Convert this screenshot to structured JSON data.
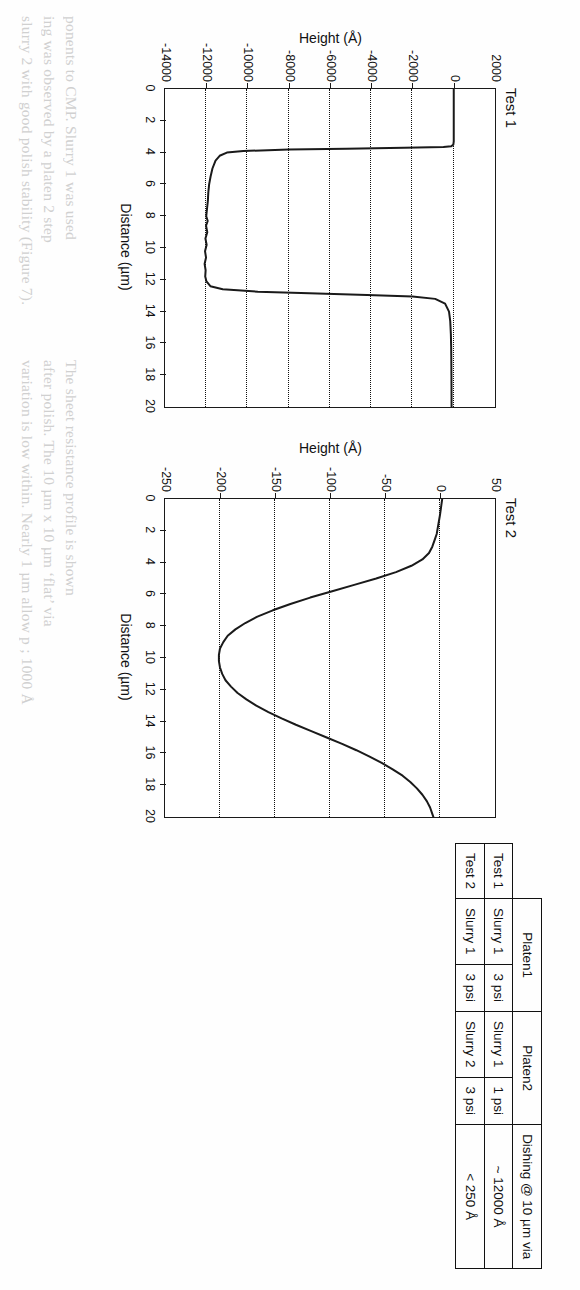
{
  "document": {
    "background_color": "#ffffff",
    "ink_color": "#1a1a1a"
  },
  "table": {
    "name": "cmp-process-comparison-table",
    "corner_label": "",
    "group_headers": [
      "",
      "Platen1",
      "Platen2",
      "Dishing @ 10 µm via"
    ],
    "sub_headers": [
      "Slurry 1",
      "3 psi",
      "Slurry 1",
      "1 psi"
    ],
    "rows": [
      {
        "test": "Test 1",
        "platen1_slurry": "Slurry 1",
        "platen1_pressure": "3 psi",
        "platen2_slurry": "Slurry 1",
        "platen2_pressure": "1 psi",
        "dishing": "~ 12000 Å"
      },
      {
        "test": "Test 2",
        "platen1_slurry": "Slurry 1",
        "platen1_pressure": "3 psi",
        "platen2_slurry": "Slurry 2",
        "platen2_pressure": "3 psi",
        "dishing": "< 250 Å"
      }
    ]
  },
  "chart_data": [
    {
      "type": "line",
      "name": "test1-profile",
      "title": "Test 1",
      "xlabel": "Distance (µm)",
      "ylabel": "Height (Å)",
      "xlim": [
        0,
        20
      ],
      "ylim": [
        -14000,
        2000
      ],
      "xticks": [
        0,
        2,
        4,
        6,
        8,
        10,
        12,
        14,
        16,
        18,
        20
      ],
      "xticklabels": [
        "0",
        "2",
        "4",
        "6",
        "8",
        "10",
        "12",
        "14",
        "16",
        "18",
        "20"
      ],
      "yticks": [
        2000,
        0,
        -2000,
        -4000,
        -6000,
        -8000,
        -10000,
        -12000,
        -14000
      ],
      "yticklabels": [
        "2000",
        "0",
        "-2000",
        "-4000",
        "-6000",
        "-8000",
        "-10000",
        "-12000",
        "-14000"
      ],
      "grid": "horizontal-dotted-at-yticks",
      "legend": "none",
      "x": [
        0.0,
        0.6,
        1.2,
        1.8,
        2.4,
        3.0,
        3.3,
        3.5,
        3.6,
        3.65,
        3.7,
        3.75,
        3.8,
        3.9,
        4.0,
        4.2,
        4.5,
        5.0,
        5.5,
        6.0,
        6.5,
        7.0,
        7.5,
        8.0,
        8.3,
        8.6,
        9.0,
        9.4,
        9.8,
        10.2,
        10.6,
        11.0,
        11.4,
        11.8,
        12.1,
        12.4,
        12.6,
        12.75,
        12.85,
        12.95,
        13.05,
        13.2,
        13.5,
        14.0,
        14.6,
        15.4,
        16.2,
        17.0,
        18.0,
        19.0,
        20.0
      ],
      "y": [
        0,
        0,
        0,
        0,
        0,
        0,
        0,
        -20,
        -120,
        -500,
        -2400,
        -5200,
        -8000,
        -10200,
        -11000,
        -11350,
        -11550,
        -11700,
        -11790,
        -11860,
        -11900,
        -11920,
        -11960,
        -12000,
        -11930,
        -12010,
        -11950,
        -12040,
        -11980,
        -12060,
        -12010,
        -12080,
        -12030,
        -12050,
        -11990,
        -11800,
        -11200,
        -9500,
        -7000,
        -4200,
        -2000,
        -900,
        -420,
        -230,
        -170,
        -140,
        -125,
        -118,
        -112,
        -108,
        -105
      ]
    },
    {
      "type": "line",
      "name": "test2-profile",
      "title": "Test 2",
      "xlabel": "Distance (µm)",
      "ylabel": "Height (Å)",
      "xlim": [
        0,
        20
      ],
      "ylim": [
        -250,
        50
      ],
      "xticks": [
        0,
        2,
        4,
        6,
        8,
        10,
        12,
        14,
        16,
        18,
        20
      ],
      "xticklabels": [
        "0",
        "2",
        "4",
        "6",
        "8",
        "10",
        "12",
        "14",
        "16",
        "18",
        "20"
      ],
      "yticks": [
        50,
        0,
        -50,
        -100,
        -150,
        -200,
        -250
      ],
      "yticklabels": [
        "50",
        "0",
        "-50",
        "-100",
        "-150",
        "-200",
        "-250"
      ],
      "grid": "horizontal-dotted-at-yticks",
      "legend": "none",
      "x": [
        0.0,
        0.5,
        1.0,
        1.4,
        1.8,
        2.2,
        2.6,
        3.0,
        3.4,
        3.8,
        4.2,
        4.6,
        5.0,
        5.4,
        5.8,
        6.2,
        6.6,
        7.0,
        7.4,
        7.8,
        8.2,
        8.6,
        9.0,
        9.4,
        9.8,
        10.2,
        10.6,
        11.0,
        11.4,
        11.8,
        12.2,
        12.6,
        13.0,
        13.4,
        13.8,
        14.2,
        14.6,
        15.0,
        15.4,
        15.8,
        16.2,
        16.6,
        17.0,
        17.4,
        17.8,
        18.2,
        18.6,
        19.0,
        19.4,
        19.8,
        20.0
      ],
      "y": [
        2,
        1,
        0,
        -1,
        -2,
        -3,
        -5,
        -7,
        -10,
        -16,
        -26,
        -40,
        -58,
        -78,
        -98,
        -118,
        -136,
        -152,
        -166,
        -177,
        -186,
        -193,
        -197,
        -200,
        -201,
        -201,
        -200,
        -198,
        -195,
        -190,
        -184,
        -176,
        -167,
        -156,
        -144,
        -131,
        -117,
        -103,
        -89,
        -76,
        -64,
        -53,
        -43,
        -34,
        -27,
        -21,
        -16,
        -12,
        -9,
        -7,
        -6
      ]
    }
  ],
  "ghost_text": {
    "lines": [
      "ponents to CMP. Slurry 1 was used",
      "ing was observed by a platen 2 step",
      "slurry 2 with good polish stability (Figure 7).",
      "The sheet resistance profile is shown",
      "after polish. The 10 µm x 10 µm ‘flat’ via",
      "variation is low within. Nearly 1 µm allow p ; 1000 Å"
    ]
  }
}
